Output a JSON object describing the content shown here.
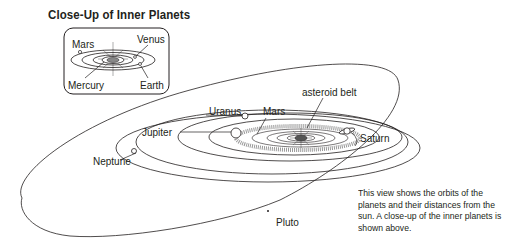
{
  "title": "Close-Up of Inner Planets",
  "inset": {
    "labels": {
      "mars": "Mars",
      "venus": "Venus",
      "mercury": "Mercury",
      "earth": "Earth"
    }
  },
  "main": {
    "labels": {
      "asteroid_belt": "asteroid belt",
      "uranus": "Uranus",
      "mars": "Mars",
      "jupiter": "Jupiter",
      "saturn": "Saturn",
      "neptune": "Neptune",
      "pluto": "Pluto"
    }
  },
  "caption": "This view shows the orbits of the planets and their distances from the sun. A close-up of the inner planets is shown above.",
  "colors": {
    "line": "#231f20",
    "background": "#ffffff"
  }
}
